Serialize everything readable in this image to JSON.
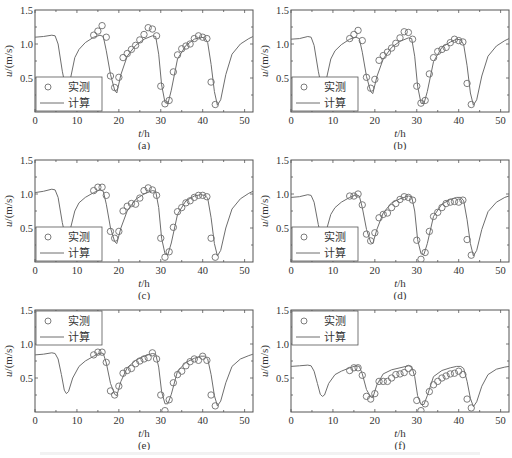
{
  "figure": {
    "legend": {
      "measured": "实测",
      "computed": "计算"
    },
    "xlabel": "t/h",
    "ylabel": "u/(m/s)",
    "xticks": [
      0,
      10,
      20,
      30,
      40,
      50
    ],
    "yticks": [
      0.5,
      1.0,
      1.5
    ],
    "ytick_labels": [
      "0.5",
      "1.0",
      "1.5"
    ],
    "xlim": [
      0,
      52
    ],
    "ylim": [
      0,
      1.5
    ],
    "colors": {
      "line": "#6e6e6e",
      "marker": "#6e6e6e",
      "axes": "#555555"
    }
  },
  "chart_data": [
    {
      "type": "line",
      "panel": "(a)",
      "title": "(a)",
      "xlabel": "t/h",
      "ylabel": "u/(m/s)",
      "xlim": [
        0,
        52
      ],
      "ylim": [
        0,
        1.5
      ],
      "legend_position": "lower-left",
      "series": [
        {
          "name": "计算",
          "kind": "line",
          "x": [
            0,
            2,
            4,
            4.8,
            5.5,
            6.5,
            7.5,
            8.5,
            9.5,
            10.5,
            12,
            14,
            15.5,
            16.3,
            17,
            18,
            19,
            19.5,
            20.5,
            22,
            24,
            26,
            28,
            28.8,
            29.5,
            30.2,
            31,
            31.7,
            32.5,
            34,
            36,
            38,
            39.5,
            40.5,
            41.2,
            42,
            42.8,
            43.5,
            44.3,
            45.5,
            47,
            49,
            51,
            52
          ],
          "y": [
            1.1,
            1.11,
            1.13,
            1.12,
            1.0,
            0.6,
            0.3,
            0.5,
            0.8,
            0.92,
            1.02,
            1.1,
            1.13,
            1.11,
            0.9,
            0.55,
            0.32,
            0.28,
            0.55,
            0.82,
            0.98,
            1.07,
            1.12,
            1.11,
            0.85,
            0.4,
            0.14,
            0.12,
            0.32,
            0.78,
            0.98,
            1.07,
            1.1,
            1.09,
            1.02,
            0.7,
            0.3,
            0.1,
            0.18,
            0.55,
            0.85,
            1.0,
            1.08,
            1.11
          ]
        },
        {
          "name": "实测",
          "kind": "scatter",
          "x": [
            14,
            15,
            16,
            17,
            18,
            19,
            20,
            21,
            22,
            23,
            24,
            25,
            26,
            27,
            28,
            29,
            30,
            31,
            32,
            33,
            34,
            35,
            36,
            37,
            38,
            39,
            40,
            41,
            42,
            43
          ],
          "y": [
            1.13,
            1.19,
            1.27,
            1.1,
            0.53,
            0.36,
            0.51,
            0.8,
            0.86,
            0.92,
            0.98,
            1.06,
            1.14,
            1.24,
            1.22,
            1.12,
            0.38,
            0.12,
            0.17,
            0.59,
            0.84,
            0.93,
            0.97,
            1.0,
            1.08,
            1.12,
            1.1,
            1.08,
            0.44,
            0.11
          ]
        }
      ]
    },
    {
      "type": "line",
      "panel": "(b)",
      "title": "(b)",
      "xlabel": "t/h",
      "ylabel": "u/(m/s)",
      "xlim": [
        0,
        52
      ],
      "ylim": [
        0,
        1.5
      ],
      "legend_position": "lower-left",
      "series": [
        {
          "name": "计算",
          "kind": "line",
          "x": [
            0,
            2,
            4,
            4.8,
            5.5,
            6.5,
            7.5,
            8.5,
            9.5,
            10.5,
            12,
            14,
            15.5,
            16.3,
            17,
            18,
            19,
            19.5,
            20.5,
            22,
            24,
            26,
            28,
            28.8,
            29.5,
            30.2,
            31,
            31.7,
            32.5,
            34,
            36,
            38,
            39.5,
            40.5,
            41.2,
            42,
            42.8,
            43.5,
            44.3,
            45.5,
            47,
            49,
            51,
            52
          ],
          "y": [
            1.07,
            1.08,
            1.11,
            1.1,
            0.98,
            0.6,
            0.3,
            0.5,
            0.78,
            0.9,
            0.99,
            1.07,
            1.1,
            1.08,
            0.88,
            0.52,
            0.3,
            0.27,
            0.52,
            0.78,
            0.95,
            1.04,
            1.09,
            1.08,
            0.82,
            0.38,
            0.13,
            0.12,
            0.3,
            0.74,
            0.95,
            1.03,
            1.07,
            1.06,
            0.99,
            0.68,
            0.28,
            0.1,
            0.18,
            0.53,
            0.82,
            0.97,
            1.05,
            1.08
          ]
        },
        {
          "name": "实测",
          "kind": "scatter",
          "x": [
            14,
            15,
            16,
            17,
            18,
            19,
            20,
            21,
            22,
            23,
            24,
            25,
            26,
            27,
            28,
            29,
            30,
            31,
            32,
            33,
            34,
            35,
            36,
            37,
            38,
            39,
            40,
            41,
            42,
            43
          ],
          "y": [
            1.08,
            1.14,
            1.2,
            1.05,
            0.51,
            0.35,
            0.48,
            0.76,
            0.83,
            0.88,
            0.94,
            1.01,
            1.09,
            1.18,
            1.17,
            1.07,
            0.38,
            0.13,
            0.17,
            0.56,
            0.8,
            0.89,
            0.92,
            0.95,
            1.02,
            1.07,
            1.05,
            1.03,
            0.42,
            0.11
          ]
        }
      ]
    },
    {
      "type": "line",
      "panel": "(c)",
      "title": "(c)",
      "xlabel": "t/h",
      "ylabel": "u/(m/s)",
      "xlim": [
        0,
        52
      ],
      "ylim": [
        0,
        1.5
      ],
      "legend_position": "lower-left",
      "series": [
        {
          "name": "计算",
          "kind": "line",
          "x": [
            0,
            2,
            4,
            4.8,
            5.5,
            6.5,
            7.5,
            8.5,
            9.5,
            10.5,
            12,
            14,
            15.5,
            16.3,
            17,
            18,
            19,
            19.5,
            20.5,
            22,
            24,
            26,
            28,
            28.8,
            29.5,
            30.2,
            31,
            31.7,
            32.5,
            34,
            36,
            38,
            39.5,
            40.5,
            41.2,
            42,
            42.8,
            43.5,
            44.3,
            45.5,
            47,
            49,
            51,
            52
          ],
          "y": [
            1.02,
            1.04,
            1.07,
            1.06,
            0.95,
            0.58,
            0.3,
            0.5,
            0.75,
            0.87,
            0.95,
            1.02,
            1.06,
            1.04,
            0.85,
            0.5,
            0.3,
            0.27,
            0.5,
            0.75,
            0.92,
            1.0,
            1.05,
            1.04,
            0.8,
            0.35,
            0.12,
            0.11,
            0.28,
            0.7,
            0.9,
            0.97,
            0.99,
            0.98,
            0.94,
            0.65,
            0.27,
            0.09,
            0.17,
            0.5,
            0.78,
            0.93,
            1.01,
            1.04
          ]
        },
        {
          "name": "实测",
          "kind": "scatter",
          "x": [
            14,
            15,
            16,
            17,
            18,
            19,
            20,
            21,
            22,
            23,
            24,
            25,
            26,
            27,
            28,
            29,
            30,
            31,
            32,
            33,
            34,
            35,
            36,
            37,
            38,
            39,
            40,
            41,
            42,
            43
          ],
          "y": [
            1.05,
            1.1,
            1.1,
            0.98,
            0.45,
            0.35,
            0.45,
            0.75,
            0.82,
            0.86,
            0.85,
            0.94,
            1.05,
            1.09,
            1.06,
            0.98,
            0.35,
            0.07,
            0.15,
            0.51,
            0.74,
            0.8,
            0.87,
            0.9,
            0.95,
            0.98,
            0.98,
            0.96,
            0.35,
            0.07
          ]
        }
      ]
    },
    {
      "type": "line",
      "panel": "(d)",
      "title": "(d)",
      "xlabel": "t/h",
      "ylabel": "u/(m/s)",
      "xlim": [
        0,
        52
      ],
      "ylim": [
        0,
        1.5
      ],
      "legend_position": "lower-left",
      "series": [
        {
          "name": "计算",
          "kind": "line",
          "x": [
            0,
            2,
            4,
            4.8,
            5.5,
            6.5,
            7.5,
            8.5,
            9.5,
            10.5,
            12,
            14,
            15.5,
            16.3,
            17,
            18,
            19,
            19.5,
            20.5,
            22,
            24,
            26,
            28,
            28.8,
            29.5,
            30.2,
            31,
            31.7,
            32.5,
            34,
            36,
            38,
            39.5,
            40.5,
            41.2,
            42,
            42.8,
            43.5,
            44.3,
            45.5,
            47,
            49,
            51,
            52
          ],
          "y": [
            0.95,
            0.96,
            0.99,
            0.98,
            0.88,
            0.55,
            0.3,
            0.48,
            0.7,
            0.8,
            0.88,
            0.95,
            0.99,
            0.97,
            0.8,
            0.48,
            0.29,
            0.27,
            0.48,
            0.72,
            0.87,
            0.93,
            0.97,
            0.96,
            0.75,
            0.33,
            0.12,
            0.11,
            0.27,
            0.67,
            0.85,
            0.92,
            0.95,
            0.95,
            0.9,
            0.62,
            0.27,
            0.09,
            0.17,
            0.48,
            0.74,
            0.88,
            0.95,
            0.97
          ]
        },
        {
          "name": "实测",
          "kind": "scatter",
          "x": [
            14,
            15,
            16,
            17,
            18,
            19,
            20,
            21,
            22,
            23,
            24,
            25,
            26,
            27,
            28,
            29,
            30,
            31,
            32,
            33,
            34,
            35,
            36,
            37,
            38,
            39,
            40,
            41,
            42,
            43
          ],
          "y": [
            0.97,
            0.97,
            1.0,
            0.84,
            0.41,
            0.31,
            0.43,
            0.65,
            0.7,
            0.72,
            0.8,
            0.86,
            0.92,
            0.96,
            0.95,
            0.91,
            0.32,
            0.04,
            0.14,
            0.45,
            0.67,
            0.73,
            0.8,
            0.86,
            0.88,
            0.89,
            0.88,
            0.91,
            0.33,
            0.1
          ]
        }
      ]
    },
    {
      "type": "line",
      "panel": "(e)",
      "title": "(e)",
      "xlabel": "t/h",
      "ylabel": "u/(m/s)",
      "xlim": [
        0,
        52
      ],
      "ylim": [
        0,
        1.5
      ],
      "legend_position": "upper-left",
      "series": [
        {
          "name": "计算",
          "kind": "line",
          "x": [
            0,
            2,
            4,
            4.8,
            5.5,
            6.3,
            7,
            7.5,
            8,
            9,
            10.5,
            12,
            14,
            15.5,
            16.3,
            17,
            18,
            19,
            19.5,
            20.5,
            22,
            24,
            26,
            28,
            28.8,
            29.5,
            30.2,
            31,
            31.7,
            32.5,
            34,
            36,
            38,
            39.5,
            40.5,
            41.2,
            42,
            42.8,
            43.5,
            44.3,
            45.5,
            47,
            49,
            51,
            52
          ],
          "y": [
            0.84,
            0.85,
            0.87,
            0.86,
            0.78,
            0.55,
            0.32,
            0.27,
            0.3,
            0.5,
            0.67,
            0.75,
            0.82,
            0.87,
            0.86,
            0.72,
            0.42,
            0.26,
            0.24,
            0.45,
            0.65,
            0.76,
            0.82,
            0.86,
            0.85,
            0.66,
            0.3,
            0.12,
            0.12,
            0.26,
            0.6,
            0.73,
            0.79,
            0.82,
            0.82,
            0.78,
            0.55,
            0.24,
            0.09,
            0.16,
            0.43,
            0.67,
            0.78,
            0.83,
            0.85
          ]
        },
        {
          "name": "实测",
          "kind": "scatter",
          "x": [
            14,
            15,
            16,
            17,
            18,
            19,
            20,
            21,
            22,
            23,
            24,
            25,
            26,
            27,
            28,
            29,
            30,
            31,
            32,
            33,
            34,
            35,
            36,
            37,
            38,
            39,
            40,
            41,
            42,
            43
          ],
          "y": [
            0.84,
            0.88,
            0.88,
            0.73,
            0.31,
            0.25,
            0.38,
            0.57,
            0.61,
            0.64,
            0.71,
            0.75,
            0.78,
            0.8,
            0.87,
            0.78,
            0.25,
            0.02,
            0.18,
            0.43,
            0.55,
            0.6,
            0.68,
            0.74,
            0.78,
            0.76,
            0.82,
            0.76,
            0.25,
            0.09
          ]
        }
      ]
    },
    {
      "type": "line",
      "panel": "(f)",
      "title": "(f)",
      "xlabel": "t/h",
      "ylabel": "u/(m/s)",
      "xlim": [
        0,
        52
      ],
      "ylim": [
        0,
        1.5
      ],
      "legend_position": "upper-left",
      "series": [
        {
          "name": "计算",
          "kind": "line",
          "x": [
            0,
            2,
            4,
            4.8,
            5.5,
            6.3,
            7,
            7.5,
            8,
            9,
            10.5,
            12,
            14,
            15.5,
            16.3,
            17,
            18,
            19,
            19.5,
            20.5,
            22,
            24,
            26,
            28,
            28.8,
            29.5,
            30.2,
            31,
            31.7,
            32.5,
            34,
            36,
            38,
            39.5,
            40.5,
            41.2,
            42,
            42.8,
            43.5,
            44.3,
            45.5,
            47,
            49,
            51,
            52
          ],
          "y": [
            0.67,
            0.68,
            0.69,
            0.68,
            0.6,
            0.42,
            0.26,
            0.23,
            0.25,
            0.42,
            0.55,
            0.6,
            0.65,
            0.68,
            0.67,
            0.56,
            0.33,
            0.22,
            0.21,
            0.4,
            0.56,
            0.62,
            0.65,
            0.68,
            0.67,
            0.52,
            0.24,
            0.11,
            0.11,
            0.24,
            0.52,
            0.61,
            0.65,
            0.67,
            0.67,
            0.64,
            0.45,
            0.2,
            0.08,
            0.15,
            0.38,
            0.55,
            0.63,
            0.66,
            0.67
          ]
        },
        {
          "name": "实测",
          "kind": "scatter",
          "x": [
            14,
            15,
            16,
            17,
            18,
            19,
            20,
            21,
            22,
            23,
            24,
            25,
            26,
            27,
            28,
            29,
            30,
            31,
            32,
            33,
            34,
            35,
            36,
            37,
            38,
            39,
            40,
            41,
            42,
            43
          ],
          "y": [
            0.61,
            0.65,
            0.65,
            0.54,
            0.23,
            0.19,
            0.27,
            0.45,
            0.45,
            0.45,
            0.5,
            0.55,
            0.56,
            0.58,
            0.64,
            0.58,
            0.17,
            0.02,
            0.12,
            0.3,
            0.4,
            0.45,
            0.5,
            0.53,
            0.56,
            0.57,
            0.6,
            0.55,
            0.19,
            0.06
          ]
        }
      ]
    }
  ]
}
